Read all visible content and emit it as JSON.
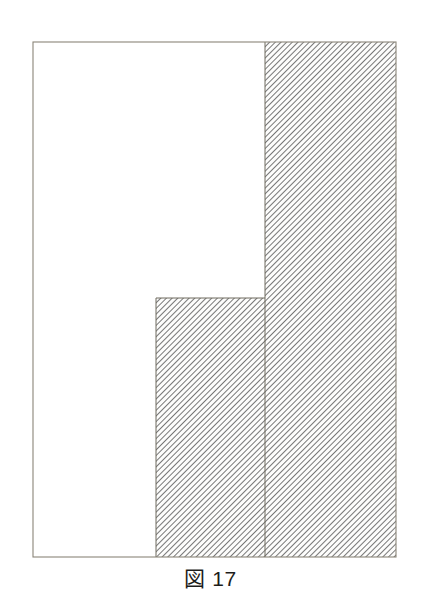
{
  "figure": {
    "caption_label": "図",
    "caption_number": "17",
    "caption_full": "図 17",
    "kind": "geometry-diagram"
  },
  "colors": {
    "background": "#ffffff",
    "outline": "#8a8578",
    "inner_line": "#6f6a5f",
    "hatch_line": "#555555",
    "hatch_background": "#fdfdfc",
    "caption_text": "#1d1d1b"
  },
  "geometry": {
    "units": "px",
    "outer_rect": {
      "x": 33,
      "y": 42,
      "width": 363,
      "height": 515
    },
    "step_corner": {
      "x": 156,
      "y": 298
    },
    "divider_x": 265,
    "hatch": {
      "angle_deg": 45,
      "direction": "backslash",
      "spacing": 4,
      "line_width": 1
    },
    "regions": [
      {
        "name": "white-region",
        "label": "unshaded L region",
        "filled": false,
        "outline_points": "33,42 265,42 265,298 156,298 156,557 33,557"
      },
      {
        "name": "hatched-lower-block",
        "label": "shaded lower middle block",
        "filled": true,
        "outline_points": "156,298 265,298 265,557 156,557"
      },
      {
        "name": "hatched-right-column",
        "label": "shaded right column",
        "filled": true,
        "outline_points": "265,42 396,42 396,557 265,557"
      }
    ]
  },
  "chart_data": {
    "type": "table",
    "title": "図 17",
    "xlabel": "",
    "ylabel": "",
    "columns": [
      "region",
      "shaded",
      "left_x",
      "right_x",
      "top_y",
      "bottom_y",
      "width",
      "height"
    ],
    "rows": [
      [
        "white-region (L shape)",
        "no",
        33,
        265,
        42,
        557,
        232,
        515
      ],
      [
        "hatched-lower-block",
        "yes",
        156,
        265,
        298,
        557,
        109,
        259
      ],
      [
        "hatched-right-column",
        "yes",
        265,
        396,
        42,
        557,
        131,
        515
      ]
    ],
    "grid": false,
    "legend": "none"
  }
}
